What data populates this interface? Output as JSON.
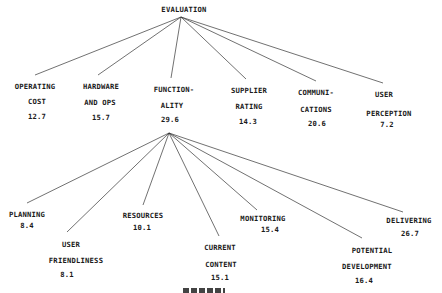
{
  "root": {
    "label": "EVALUATION"
  },
  "level1": [
    {
      "line1": "OPERATING",
      "line2": "COST",
      "weight": "12.7"
    },
    {
      "line1": "HARDWARE",
      "line2": "AND OPS",
      "weight": "15.7"
    },
    {
      "line1": "FUNCTION-",
      "line2": "ALITY",
      "weight": "29.6"
    },
    {
      "line1": "SUPPLIER",
      "line2": "RATING",
      "weight": "14.3"
    },
    {
      "line1": "COMMUNI-",
      "line2": "CATIONS",
      "weight": "20.6"
    },
    {
      "line1": "USER",
      "line2": "PERCEPTION",
      "weight": "7.2"
    }
  ],
  "functionality_children": [
    {
      "line1": "PLANNING",
      "line2": "",
      "weight": "8.4"
    },
    {
      "line1": "USER",
      "line2": "FRIENDLINESS",
      "weight": "8.1"
    },
    {
      "line1": "RESOURCES",
      "line2": "",
      "weight": "10.1"
    },
    {
      "line1": "CURRENT",
      "line2": "CONTENT",
      "weight": "15.1"
    },
    {
      "line1": "MONITORING",
      "line2": "",
      "weight": "15.4"
    },
    {
      "line1": "POTENTIAL",
      "line2": "DEVELOPMENT",
      "weight": "16.4"
    },
    {
      "line1": "DELIVERING",
      "line2": "",
      "weight": "26.7"
    }
  ],
  "style": {
    "line_color": "#333333",
    "text_color": "#1a1a1a",
    "background": "#ffffff"
  }
}
